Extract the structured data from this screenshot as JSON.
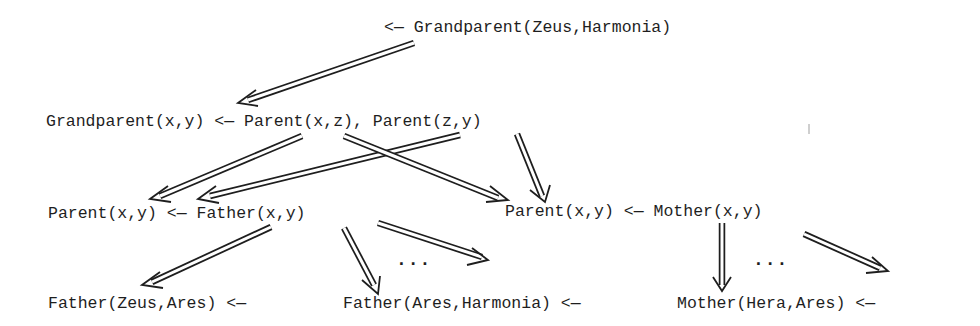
{
  "diagram": {
    "type": "resolution-tree",
    "nodes": {
      "goal": "<— Grandparent(Zeus,Harmonia)",
      "rule_grandparent": "Grandparent(x,y) <— Parent(x,z), Parent(z,y)",
      "rule_parent_father": "Parent(x,y) <— Father(x,y)",
      "rule_parent_mother": "Parent(x,y) <— Mother(x,y)",
      "fact_father_zeus_ares": "Father(Zeus,Ares) <—",
      "fact_father_ares_harmonia": "Father(Ares,Harmonia) <—",
      "fact_mother_hera_ares": "Mother(Hera,Ares) <—"
    },
    "ellipses": {
      "father_more": "...",
      "mother_more": "..."
    },
    "edges": [
      {
        "from": "goal",
        "to": "rule_grandparent"
      },
      {
        "from": "rule_grandparent.Parent(x,z)",
        "to": "rule_parent_father"
      },
      {
        "from": "rule_grandparent.Parent(x,z)",
        "to": "rule_parent_mother"
      },
      {
        "from": "rule_grandparent.Parent(z,y)",
        "to": "rule_parent_father"
      },
      {
        "from": "rule_grandparent.Parent(z,y)",
        "to": "rule_parent_mother"
      },
      {
        "from": "rule_parent_father",
        "to": "fact_father_zeus_ares"
      },
      {
        "from": "rule_parent_father",
        "to": "fact_father_ares_harmonia"
      },
      {
        "from": "rule_parent_father",
        "to": "father_more"
      },
      {
        "from": "rule_parent_mother",
        "to": "fact_mother_hera_ares"
      },
      {
        "from": "rule_parent_mother",
        "to": "mother_more"
      }
    ]
  }
}
